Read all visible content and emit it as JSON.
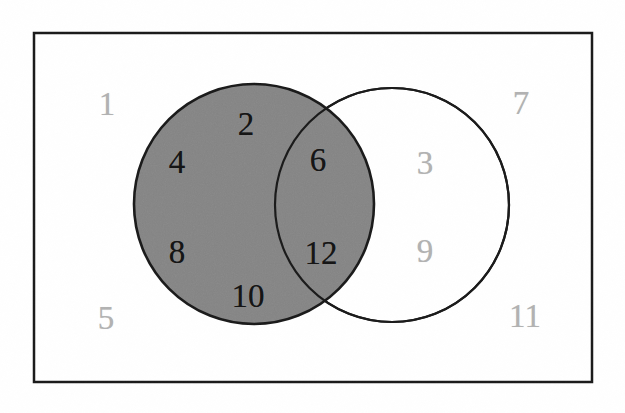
{
  "figure": {
    "kind": "venn-diagram",
    "background_color": "#ffffff",
    "outline_color": "#1a1a1a",
    "shaded_fill_color": "#858585",
    "unshaded_fill_color": "#ffffff",
    "inside_label_color": "#141414",
    "outside_label_color": "#b2b2b2"
  },
  "universal_set_rectangle": {
    "name": "universal-set-rectangle",
    "x": 34,
    "y": 33,
    "width": 558,
    "height": 349,
    "stroke_width": 2.5
  },
  "circles": [
    {
      "name": "left-circle",
      "cx": 254,
      "cy": 204,
      "r": 120,
      "fill": "#858585",
      "shaded": true
    },
    {
      "name": "right-circle",
      "cx": 392,
      "cy": 205,
      "r": 117,
      "fill": "#ffffff",
      "shaded": false
    }
  ],
  "shaded_regions": [
    "left-circle-only",
    "intersection"
  ],
  "labels": {
    "inside_shaded": [
      {
        "text": "4",
        "x": 177,
        "y": 162,
        "region": "left-only"
      },
      {
        "text": "2",
        "x": 246,
        "y": 124,
        "region": "left-only"
      },
      {
        "text": "8",
        "x": 177,
        "y": 252,
        "region": "left-only"
      },
      {
        "text": "10",
        "x": 248,
        "y": 296,
        "region": "left-only"
      },
      {
        "text": "6",
        "x": 318,
        "y": 160,
        "region": "intersection"
      },
      {
        "text": "12",
        "x": 321,
        "y": 253,
        "region": "intersection"
      }
    ],
    "unshaded": [
      {
        "text": "3",
        "x": 425,
        "y": 163,
        "region": "right-only"
      },
      {
        "text": "9",
        "x": 425,
        "y": 251,
        "region": "right-only"
      },
      {
        "text": "1",
        "x": 107,
        "y": 104,
        "region": "outside-both"
      },
      {
        "text": "7",
        "x": 521,
        "y": 103,
        "region": "outside-both"
      },
      {
        "text": "5",
        "x": 106,
        "y": 318,
        "region": "outside-both"
      },
      {
        "text": "11",
        "x": 525,
        "y": 316,
        "region": "outside-both"
      }
    ]
  },
  "chart_data": {
    "type": "venn",
    "title": "",
    "universe_label": "",
    "sets": [
      {
        "name": "left-circle",
        "shaded": true,
        "elements": [
          4,
          2,
          8,
          10,
          6,
          12
        ]
      },
      {
        "name": "right-circle",
        "shaded": false,
        "elements": [
          6,
          12,
          3,
          9
        ]
      }
    ],
    "regions": [
      {
        "region": "left-only",
        "shaded": true,
        "values": [
          4,
          2,
          8,
          10
        ]
      },
      {
        "region": "intersection",
        "shaded": true,
        "values": [
          6,
          12
        ]
      },
      {
        "region": "right-only",
        "shaded": false,
        "values": [
          3,
          9
        ]
      },
      {
        "region": "outside-both",
        "shaded": false,
        "values": [
          1,
          7,
          5,
          11
        ]
      }
    ],
    "all_values": [
      1,
      2,
      3,
      4,
      5,
      6,
      7,
      8,
      9,
      10,
      11,
      12
    ]
  }
}
